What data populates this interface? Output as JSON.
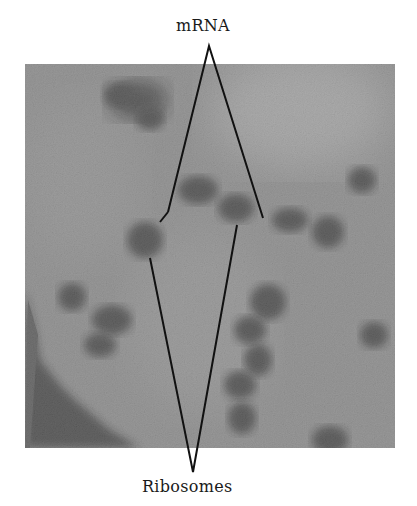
{
  "figure": {
    "type": "electron micrograph",
    "labels": {
      "top": "mRNA",
      "bottom": "Ribosomes"
    },
    "colors": {
      "background": "#ffffff",
      "micrograph_base": "#8c8c8c",
      "micrograph_light": "#b4b4b4",
      "dark_particles": "#1e1e1e",
      "pointer_lines": "#111111",
      "label_text": "#1a1a1a"
    }
  }
}
